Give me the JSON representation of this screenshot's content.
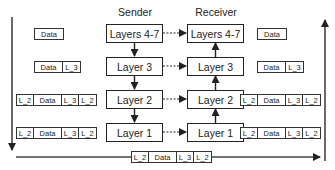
{
  "diagram": {
    "sender_label": "Sender",
    "receiver_label": "Receiver",
    "sender_layers": [
      "Layers 4-7",
      "Layer 3",
      "Layer 2",
      "Layer 1"
    ],
    "receiver_layers": [
      "Layers 4-7",
      "Layer 3",
      "Layer 2",
      "Layer 1"
    ],
    "sender_packets": [
      [
        "Data"
      ],
      [
        "Data",
        "L_3"
      ],
      [
        "L_2",
        "Data",
        "L_3",
        "L_2"
      ],
      [
        "L_2",
        "Data",
        "L_3",
        "L_2"
      ]
    ],
    "receiver_packets": [
      [
        "Data"
      ],
      [
        "Data",
        "L_3"
      ],
      [
        "L_2",
        "Data",
        "L_3",
        "L_2"
      ],
      [
        "L_2",
        "Data",
        "L_3",
        "L_2"
      ]
    ],
    "wire_packet": [
      "L_2",
      "Data",
      "L_3",
      "L_2"
    ],
    "colors": {
      "line": "#222222",
      "background": "#ffffff"
    }
  }
}
